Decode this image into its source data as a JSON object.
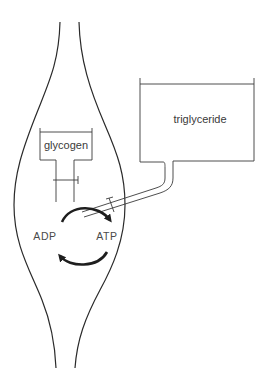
{
  "diagram": {
    "type": "schematic",
    "stores": {
      "glycogen": {
        "label": "glycogen"
      },
      "triglyceride": {
        "label": "triglyceride"
      }
    },
    "cycle": {
      "left_label": "ADP",
      "right_label": "ATP"
    },
    "colors": {
      "line": "#2a2a2a",
      "text": "#3a3a3a",
      "background": "#ffffff"
    }
  }
}
